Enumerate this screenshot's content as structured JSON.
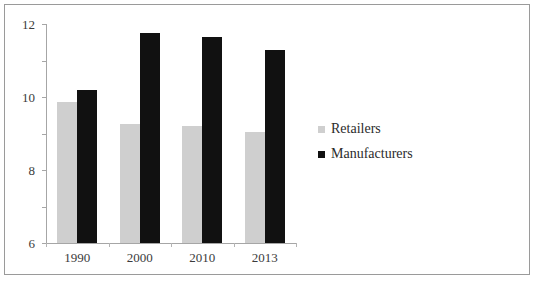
{
  "chart_data": {
    "type": "bar",
    "title": "",
    "xlabel": "",
    "ylabel": "",
    "categories": [
      "1990",
      "2000",
      "2010",
      "2013"
    ],
    "series": [
      {
        "name": "Retailers",
        "color": "#cfcfcf",
        "values": [
          7.7,
          6.5,
          6.4,
          6.1
        ]
      },
      {
        "name": "Manufacturers",
        "color": "#111111",
        "values": [
          8.4,
          11.5,
          11.3,
          10.6
        ]
      }
    ],
    "ylim": [
      0,
      12
    ],
    "yticks": [
      0,
      2,
      4,
      6,
      8,
      10,
      12
    ],
    "ytick_labels": [
      "0",
      "2",
      "4",
      "6",
      "8",
      "10",
      "12"
    ],
    "grid": false,
    "legend_position": "right"
  },
  "legend": {
    "items": [
      {
        "label": "Retailers",
        "swatch": "legend-swatch-retailers"
      },
      {
        "label": "Manufacturers",
        "swatch": "legend-swatch-manufacturers"
      }
    ]
  }
}
